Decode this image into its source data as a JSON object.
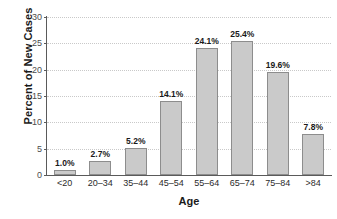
{
  "chart_data": {
    "type": "bar",
    "title": "",
    "xlabel": "Age",
    "ylabel": "Percent of New Cases",
    "categories": [
      "<20",
      "20–34",
      "35–44",
      "45–54",
      "55–64",
      "65–74",
      "75–84",
      ">84"
    ],
    "values": [
      1.0,
      2.7,
      5.2,
      14.1,
      24.1,
      25.4,
      19.6,
      7.8
    ],
    "data_labels": [
      "1.0%",
      "2.7%",
      "5.2%",
      "14.1%",
      "24.1%",
      "25.4%",
      "19.6%",
      "7.8%"
    ],
    "ylim": [
      0,
      30
    ],
    "yticks": [
      0,
      5,
      10,
      15,
      20,
      25,
      30
    ],
    "ytick_labels": [
      "0",
      "5",
      "10",
      "15",
      "20",
      "25",
      "30"
    ],
    "grid": true,
    "grid_axis": "y",
    "grid_style": "dotted",
    "legend": false,
    "bar_fill": "#cacaca",
    "bar_edge": "#8d8d8d",
    "background": "#ffffff",
    "axis_color": "#5a5a5a",
    "grid_color": "#c9c9c9"
  }
}
